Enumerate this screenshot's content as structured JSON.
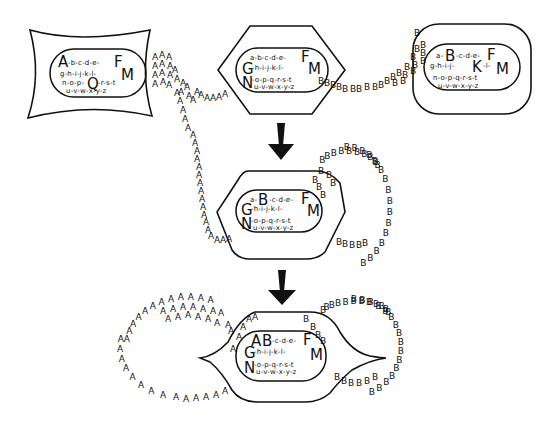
{
  "diagram": {
    "cells": {
      "cell1": {
        "shape": "rounded-rectangle-concave",
        "line1_big_left": "A",
        "line1_small": "-b-c-d-e-",
        "line1_big_right": "F",
        "line2_small": "g-h-i-j-k-l-",
        "line2_big_right": "M",
        "line3_small_left": "n-o-p-",
        "line3_big": "Q",
        "line3_small_right": "-r-s-t",
        "line4_small": "u-v-w-x-y-z",
        "trail_letter": "A"
      },
      "cell2": {
        "shape": "hexagon",
        "line1_small": "a-b-c-d-e-",
        "line1_big_right": "F",
        "line2_big_left": "G",
        "line2_small": "-h-i-j-k-l-",
        "line2_big_right": "M",
        "line3_big_left": "N",
        "line3_small": "-o-p-q-r-s-t",
        "line4_small": "u-v-w-x-y-z"
      },
      "cell3": {
        "shape": "rounded-square",
        "line1_small_left": "a-",
        "line1_big": "B",
        "line1_small": "-c-d-e-",
        "line1_big_right": "F",
        "line2_small_left": "g-h-i-j-",
        "line2_big": "K",
        "line2_small_right": "-l-",
        "line2_big_right": "M",
        "line3_small": "n-o-p-q-r-s-t",
        "line4_small": "u-v-w-x-y-z",
        "trail_letter": "B"
      },
      "cell4": {
        "shape": "hexagon",
        "line1_small_left": "a-",
        "line1_big": "B",
        "line1_small": "-c-d-e-",
        "line1_big_right": "F",
        "line2_big_left": "G",
        "line2_small": "-h-i-j-k-l-",
        "line2_big_right": "M",
        "line3_big_left": "N",
        "line3_small": "-o-p-q-r-s-t",
        "line4_small": "u-v-w-x-y-z"
      },
      "cell5": {
        "shape": "lens-with-pointed-ends",
        "line1_big_a": "A",
        "line1_big_b": "B",
        "line1_small": "-c-d-e-",
        "line1_big_right": "F",
        "line2_big_left": "G",
        "line2_small": "-h-i-j-k-l-",
        "line2_big_right": "M",
        "line3_big_left": "N",
        "line3_small": "-o-p-q-r-s-t",
        "line4_small": "u-v-w-x-y-z"
      }
    },
    "trail_letters": {
      "a": "A",
      "b": "B"
    },
    "arrows": [
      "down",
      "down"
    ]
  }
}
